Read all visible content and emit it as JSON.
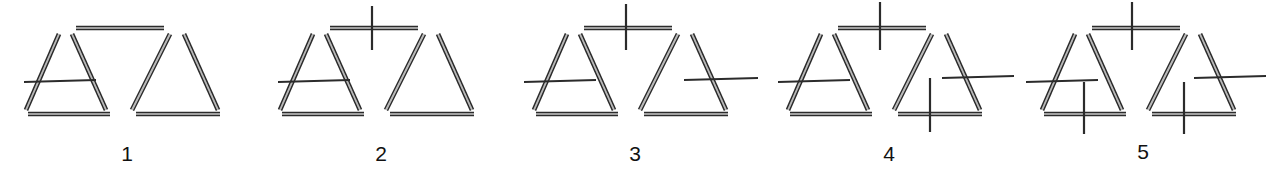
{
  "page": {
    "background_color": "#ffffff",
    "stick_color": "#2b2b2b",
    "label_color": "#111111",
    "width": 1270,
    "height": 183
  },
  "figures": [
    {
      "label": "1",
      "label_x": 123,
      "label_y": 142,
      "cross_count": 1,
      "crosses": [
        {
          "name": "cross-left-side-horizontal",
          "orientation": "horizontal",
          "x1": 24,
          "y1": 82,
          "x2": 96,
          "y2": 80
        }
      ]
    },
    {
      "label": "2",
      "label_x": 123,
      "label_y": 142,
      "cross_count": 2,
      "crosses": [
        {
          "name": "cross-left-side-horizontal",
          "orientation": "horizontal",
          "x1": 24,
          "y1": 82,
          "x2": 96,
          "y2": 80
        },
        {
          "name": "cross-top-bar-vertical",
          "orientation": "vertical",
          "x1": 118,
          "y1": 6,
          "x2": 118,
          "y2": 50
        }
      ]
    },
    {
      "label": "3",
      "label_x": 123,
      "label_y": 142,
      "cross_count": 3,
      "crosses": [
        {
          "name": "cross-left-side-horizontal",
          "orientation": "horizontal",
          "x1": 16,
          "y1": 82,
          "x2": 88,
          "y2": 80
        },
        {
          "name": "cross-top-bar-vertical",
          "orientation": "vertical",
          "x1": 118,
          "y1": 4,
          "x2": 118,
          "y2": 50
        },
        {
          "name": "cross-right-side-horizontal",
          "orientation": "horizontal",
          "x1": 176,
          "y1": 80,
          "x2": 250,
          "y2": 78
        }
      ]
    },
    {
      "label": "4",
      "label_x": 123,
      "label_y": 142,
      "cross_count": 4,
      "crosses": [
        {
          "name": "cross-left-side-horizontal",
          "orientation": "horizontal",
          "x1": 16,
          "y1": 82,
          "x2": 88,
          "y2": 80
        },
        {
          "name": "cross-top-bar-vertical",
          "orientation": "vertical",
          "x1": 118,
          "y1": 2,
          "x2": 118,
          "y2": 50
        },
        {
          "name": "cross-right-side-horizontal",
          "orientation": "horizontal",
          "x1": 180,
          "y1": 78,
          "x2": 252,
          "y2": 76
        },
        {
          "name": "cross-right-base-vertical",
          "orientation": "vertical",
          "x1": 168,
          "y1": 78,
          "x2": 168,
          "y2": 132
        }
      ]
    },
    {
      "label": "5",
      "label_x": 123,
      "label_y": 140,
      "cross_count": 5,
      "crosses": [
        {
          "name": "cross-left-side-horizontal",
          "orientation": "horizontal",
          "x1": 10,
          "y1": 82,
          "x2": 82,
          "y2": 80
        },
        {
          "name": "cross-top-bar-vertical",
          "orientation": "vertical",
          "x1": 116,
          "y1": 2,
          "x2": 116,
          "y2": 50
        },
        {
          "name": "cross-right-side-horizontal",
          "orientation": "horizontal",
          "x1": 178,
          "y1": 78,
          "x2": 250,
          "y2": 76
        },
        {
          "name": "cross-right-base-vertical",
          "orientation": "vertical",
          "x1": 168,
          "y1": 82,
          "x2": 168,
          "y2": 134
        },
        {
          "name": "cross-left-base-vertical",
          "orientation": "vertical",
          "x1": 68,
          "y1": 82,
          "x2": 68,
          "y2": 134
        }
      ]
    }
  ],
  "shared_skeleton": {
    "description": "Two triangles sharing a top horizontal bar, drawn as doubled matchstick lines",
    "sticks": [
      {
        "name": "left-triangle-left-side",
        "x1": 45,
        "y1": 28,
        "x2": 12,
        "y2": 104
      },
      {
        "name": "left-triangle-right-side",
        "x1": 58,
        "y1": 28,
        "x2": 92,
        "y2": 104
      },
      {
        "name": "left-triangle-base",
        "x1": 14,
        "y1": 108,
        "x2": 96,
        "y2": 108
      },
      {
        "name": "top-horizontal-bar",
        "x1": 62,
        "y1": 22,
        "x2": 150,
        "y2": 22
      },
      {
        "name": "right-triangle-left-side",
        "x1": 156,
        "y1": 28,
        "x2": 118,
        "y2": 104
      },
      {
        "name": "right-triangle-right-side",
        "x1": 170,
        "y1": 28,
        "x2": 204,
        "y2": 104
      },
      {
        "name": "right-triangle-base",
        "x1": 122,
        "y1": 108,
        "x2": 206,
        "y2": 108
      }
    ]
  },
  "figure_offsets": [
    0,
    254,
    508,
    762,
    1016
  ]
}
